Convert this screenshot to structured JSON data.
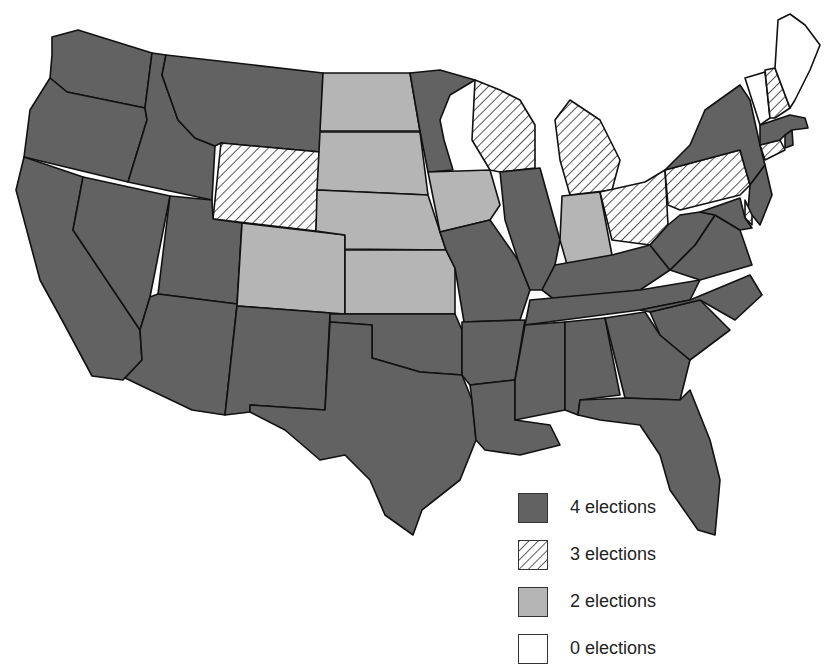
{
  "categories": {
    "four": {
      "label": "4 elections",
      "fill": "#626262",
      "pattern": "solid"
    },
    "three": {
      "label": "3 elections",
      "fill": "#ffffff",
      "pattern": "hatch"
    },
    "two": {
      "label": "2 elections",
      "fill": "#b5b5b5",
      "pattern": "solid"
    },
    "zero": {
      "label": "0 elections",
      "fill": "#ffffff",
      "pattern": "solid"
    }
  },
  "legend": [
    {
      "key": "four",
      "label": "4 elections"
    },
    {
      "key": "three",
      "label": "3 elections"
    },
    {
      "key": "two",
      "label": "2 elections"
    },
    {
      "key": "zero",
      "label": "0 elections"
    }
  ],
  "states": {
    "WA": "four",
    "OR": "four",
    "CA": "four",
    "ID": "four",
    "NV": "four",
    "MT": "four",
    "WY": "three",
    "UT": "four",
    "AZ": "four",
    "CO": "two",
    "NM": "four",
    "ND": "two",
    "SD": "two",
    "NE": "two",
    "KS": "two",
    "OK": "four",
    "TX": "four",
    "MN": "four",
    "IA": "two",
    "MO": "four",
    "AR": "four",
    "LA": "four",
    "WI": "three",
    "IL": "four",
    "MI": "three",
    "IN": "two",
    "OH": "three",
    "KY": "four",
    "TN": "four",
    "MS": "four",
    "AL": "four",
    "GA": "four",
    "FL": "four",
    "SC": "four",
    "NC": "four",
    "VA": "four",
    "WV": "four",
    "PA": "three",
    "NY": "four",
    "NJ": "four",
    "DE": "three",
    "MD": "four",
    "CT": "three",
    "RI": "four",
    "MA": "four",
    "VT": "zero",
    "NH": "three",
    "ME": "zero"
  }
}
